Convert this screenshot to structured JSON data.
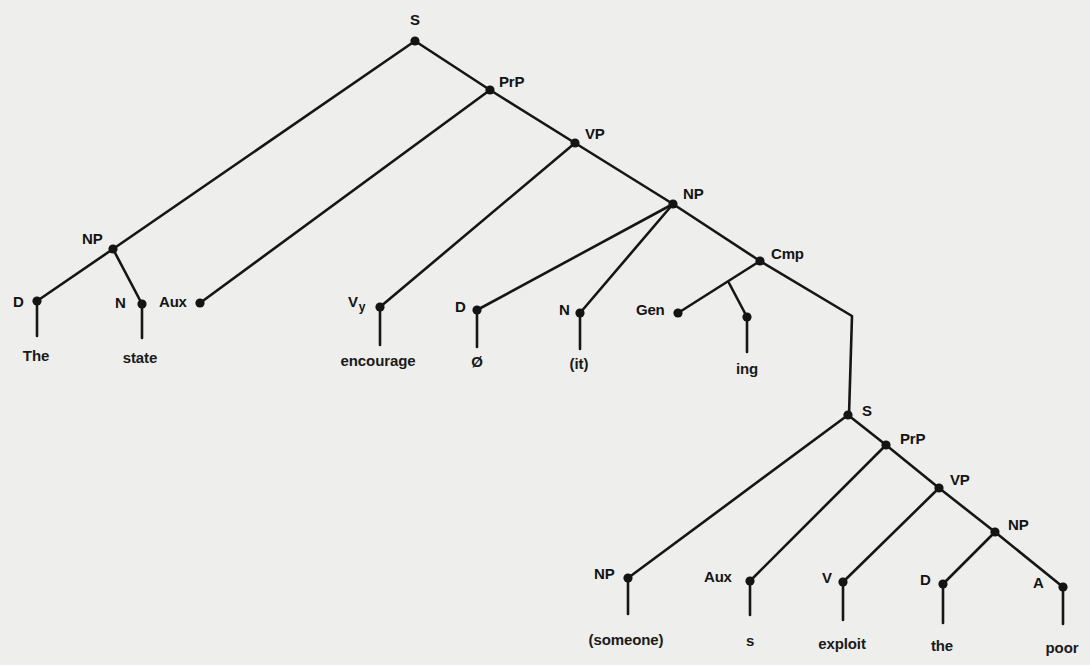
{
  "diagram": {
    "type": "syntax-tree",
    "colors": {
      "background": "#eeeeec",
      "ink": "#141414"
    },
    "nodes": [
      {
        "id": "s1",
        "label": "S",
        "x": 415,
        "y": 41,
        "lx": 410,
        "ly": 12
      },
      {
        "id": "prp1",
        "label": "PrP",
        "x": 490,
        "y": 90,
        "lx": 499,
        "ly": 74
      },
      {
        "id": "vp1",
        "label": "VP",
        "x": 575,
        "y": 143,
        "lx": 585,
        "ly": 126
      },
      {
        "id": "np1",
        "label": "NP",
        "x": 673,
        "y": 204,
        "lx": 683,
        "ly": 186
      },
      {
        "id": "cmp",
        "label": "Cmp",
        "x": 760,
        "y": 261,
        "lx": 771,
        "ly": 246
      },
      {
        "id": "np_subj",
        "label": "NP",
        "x": 113,
        "y": 249,
        "lx": 82,
        "ly": 231
      },
      {
        "id": "d1",
        "label": "D",
        "x": 37,
        "y": 301,
        "lx": 13,
        "ly": 294
      },
      {
        "id": "n1",
        "label": "N",
        "x": 142,
        "y": 304,
        "lx": 115,
        "ly": 295
      },
      {
        "id": "aux1",
        "label": "Aux",
        "x": 200,
        "y": 303,
        "lx": 159,
        "ly": 294
      },
      {
        "id": "vy",
        "label": "V",
        "sub": "y",
        "x": 380,
        "y": 307,
        "lx": 348,
        "ly": 294
      },
      {
        "id": "d2",
        "label": "D",
        "x": 477,
        "y": 310,
        "lx": 455,
        "ly": 299
      },
      {
        "id": "n2",
        "label": "N",
        "x": 580,
        "y": 313,
        "lx": 559,
        "ly": 302
      },
      {
        "id": "gen",
        "label": "Gen",
        "x": 678,
        "y": 313,
        "lx": 636,
        "ly": 302
      },
      {
        "id": "ing_node",
        "label": "",
        "x": 747,
        "y": 317,
        "lx": 0,
        "ly": 0
      },
      {
        "id": "s2",
        "label": "S",
        "x": 848,
        "y": 415,
        "lx": 862,
        "ly": 403
      },
      {
        "id": "prp2",
        "label": "PrP",
        "x": 886,
        "y": 445,
        "lx": 900,
        "ly": 431
      },
      {
        "id": "vp2",
        "label": "VP",
        "x": 939,
        "y": 488,
        "lx": 950,
        "ly": 472
      },
      {
        "id": "np2",
        "label": "NP",
        "x": 995,
        "y": 532,
        "lx": 1008,
        "ly": 517
      },
      {
        "id": "np3",
        "label": "NP",
        "x": 628,
        "y": 578,
        "lx": 594,
        "ly": 566
      },
      {
        "id": "aux2",
        "label": "Aux",
        "x": 750,
        "y": 581,
        "lx": 704,
        "ly": 569
      },
      {
        "id": "v2",
        "label": "V",
        "x": 843,
        "y": 582,
        "lx": 822,
        "ly": 570
      },
      {
        "id": "d3",
        "label": "D",
        "x": 943,
        "y": 584,
        "lx": 920,
        "ly": 572
      },
      {
        "id": "a1",
        "label": "A",
        "x": 1063,
        "y": 587,
        "lx": 1033,
        "ly": 575
      }
    ],
    "edges": [
      {
        "from": "s1",
        "to": "np_subj"
      },
      {
        "from": "s1",
        "to": "prp1"
      },
      {
        "from": "np_subj",
        "to": "d1"
      },
      {
        "from": "np_subj",
        "to": "n1"
      },
      {
        "from": "prp1",
        "to": "aux1"
      },
      {
        "from": "prp1",
        "to": "vp1"
      },
      {
        "from": "vp1",
        "to": "vy"
      },
      {
        "from": "vp1",
        "to": "np1"
      },
      {
        "from": "np1",
        "to": "d2"
      },
      {
        "from": "np1",
        "to": "n2"
      },
      {
        "from": "np1",
        "to": "cmp"
      },
      {
        "from": "cmp",
        "to": "gen"
      },
      {
        "from": "s2",
        "to": "np3"
      },
      {
        "from": "s2",
        "to": "prp2"
      },
      {
        "from": "prp2",
        "to": "aux2"
      },
      {
        "from": "prp2",
        "to": "vp2"
      },
      {
        "from": "vp2",
        "to": "v2"
      },
      {
        "from": "vp2",
        "to": "np2"
      },
      {
        "from": "np2",
        "to": "d3"
      },
      {
        "from": "np2",
        "to": "a1"
      }
    ],
    "polylines": [
      {
        "name": "ing-branch",
        "points": [
          [
            729,
            283
          ],
          [
            747,
            317
          ]
        ]
      },
      {
        "name": "cmp-to-embedded-s",
        "points": [
          [
            760,
            261
          ],
          [
            852,
            316
          ],
          [
            849,
            415
          ]
        ]
      }
    ],
    "leaves": [
      {
        "node": "d1",
        "word": "The",
        "stem_end": 336,
        "wx": 36,
        "wy": 348
      },
      {
        "node": "n1",
        "word": "state",
        "stem_end": 338,
        "wx": 140,
        "wy": 350
      },
      {
        "node": "vy",
        "word": "encourage",
        "stem_end": 345,
        "wx": 378,
        "wy": 353
      },
      {
        "node": "d2",
        "word": "Ø",
        "stem_end": 347,
        "wx": 477,
        "wy": 354
      },
      {
        "node": "n2",
        "word": "(it)",
        "stem_end": 349,
        "wx": 579,
        "wy": 356
      },
      {
        "node": "ing_node",
        "word": "ing",
        "stem_end": 352,
        "wx": 747,
        "wy": 361
      },
      {
        "node": "np3",
        "word": "(someone)",
        "stem_end": 614,
        "wx": 626,
        "wy": 632
      },
      {
        "node": "aux2",
        "word": "s",
        "stem_end": 615,
        "wx": 750,
        "wy": 633
      },
      {
        "node": "v2",
        "word": "exploit",
        "stem_end": 620,
        "wx": 842,
        "wy": 636
      },
      {
        "node": "d3",
        "word": "the",
        "stem_end": 623,
        "wx": 942,
        "wy": 638
      },
      {
        "node": "a1",
        "word": "poor",
        "stem_end": 624,
        "wx": 1062,
        "wy": 640
      }
    ]
  }
}
